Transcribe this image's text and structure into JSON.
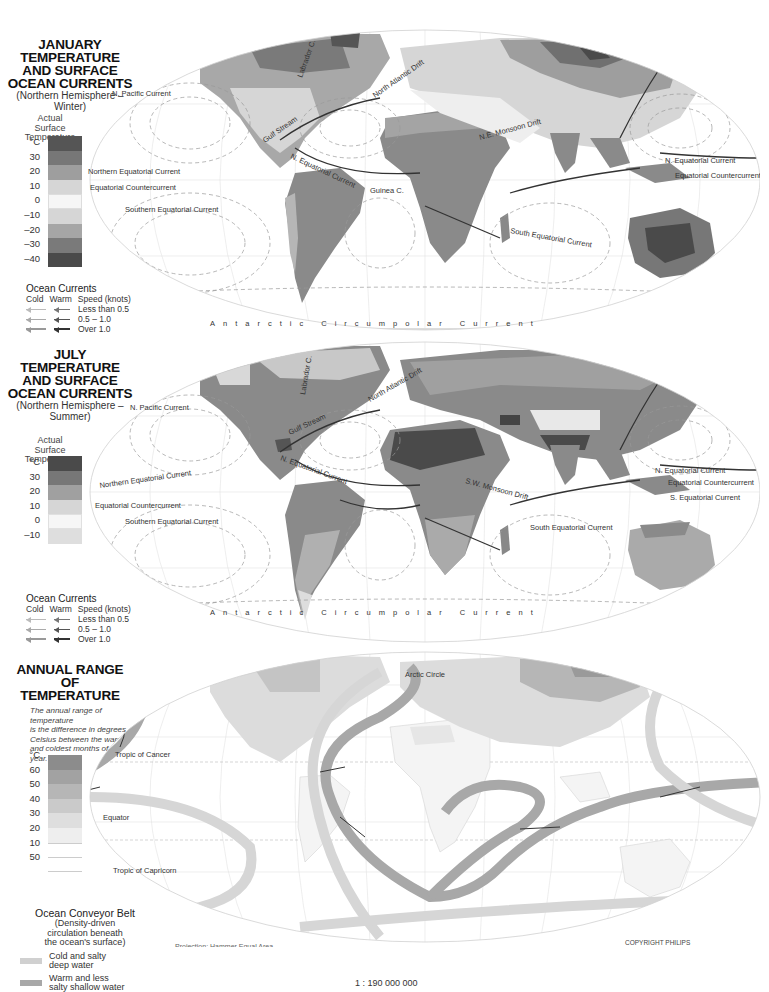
{
  "maps": [
    {
      "id": "january",
      "title_lines": [
        "JANUARY",
        "TEMPERATURE",
        "AND SURFACE",
        "OCEAN CURRENTS"
      ],
      "subtitle_lines": [
        "(Northern Hemisphere –",
        "Winter)"
      ],
      "scale_label_lines": [
        "Actual",
        "Surface",
        "Temperature"
      ],
      "scale_unit": "°C",
      "scale_ticks": [
        "30",
        "20",
        "10",
        "0",
        "–10",
        "–20",
        "–30",
        "–40"
      ],
      "scale_colors": [
        "#5a5a5a",
        "#7a7a7a",
        "#a0a0a0",
        "#d8d8d8",
        "#f4f4f4",
        "#d8d8d8",
        "#a8a8a8",
        "#7a7a7a",
        "#4a4a4a"
      ],
      "ocean_currents": {
        "title": "Ocean Currents",
        "headers": [
          "Cold",
          "Warm",
          "Speed (knots)"
        ],
        "rows": [
          "Less than 0.5",
          "0.5 – 1.0",
          "Over 1.0"
        ]
      },
      "current_labels": [
        "N. Pacific Current",
        "Californian Current",
        "Labrador C.",
        "North Atlantic Drift",
        "Gulf Stream",
        "N. Equatorial Current",
        "Northern Equatorial Current",
        "Equatorial Countercurrent",
        "Southern Equatorial Current",
        "Guinea C.",
        "Benguela Current",
        "Brazil Current",
        "Peru (Humboldt) Current",
        "Agulhas C.",
        "N.E. Monsoon Drift",
        "South Equatorial Current",
        "Oya Siwo",
        "Kuro Siwo",
        "N. Equatorial Current",
        "Equatorial Countercurrent",
        "Antarctic Circumpolar Current"
      ]
    },
    {
      "id": "july",
      "title_lines": [
        "JULY",
        "TEMPERATURE",
        "AND SURFACE",
        "OCEAN CURRENTS"
      ],
      "subtitle_lines": [
        "(Northern Hemisphere –",
        "Summer)"
      ],
      "scale_label_lines": [
        "Actual",
        "Surface",
        "Temperature"
      ],
      "scale_unit": "°C",
      "scale_ticks": [
        "30",
        "20",
        "10",
        "0",
        "–10"
      ],
      "scale_colors": [
        "#4a4a4a",
        "#7a7a7a",
        "#a0a0a0",
        "#d4d4d4",
        "#f4f4f4",
        "#dcdcdc"
      ],
      "ocean_currents": {
        "title": "Ocean Currents",
        "headers": [
          "Cold",
          "Warm",
          "Speed (knots)"
        ],
        "rows": [
          "Less than 0.5",
          "0.5 – 1.0",
          "Over 1.0"
        ]
      },
      "current_labels": [
        "N. Pacific Current",
        "Labrador C.",
        "North Atlantic Drift",
        "Gulf Stream",
        "N. Equatorial Current",
        "Northern Equatorial Current",
        "Equatorial Countercurrent",
        "Southern Equatorial Current",
        "Guinea C.",
        "Benguela Current",
        "Brazil Current",
        "Peru (Humboldt) Current",
        "Agulhas C.",
        "S.W. Monsoon Drift",
        "South Equatorial Current",
        "Oya Siwo",
        "Kuro Siwo",
        "N. Equatorial Current",
        "Equatorial Countercurrent",
        "S. Equatorial Current",
        "Antarctic Circumpolar Current"
      ]
    },
    {
      "id": "annual-range",
      "title_lines": [
        "ANNUAL RANGE",
        "OF",
        "TEMPERATURE"
      ],
      "note_lines": [
        "The annual range of temperature",
        "is the difference in degrees",
        "Celsius between the warmest",
        "and coldest months of the",
        "year."
      ],
      "scale_unit": "°C",
      "scale_ticks": [
        "60",
        "50",
        "40",
        "30",
        "20",
        "10",
        "50"
      ],
      "scale_colors": [
        "#8c8c8c",
        "#a0a0a0",
        "#b4b4b4",
        "#c8c8c8",
        "#dcdcdc",
        "#ececec",
        "#ffffff",
        "#ffffff"
      ],
      "map_labels": {
        "arctic_circle": "Arctic Circle",
        "tropic_cancer": "Tropic of Cancer",
        "equator": "Equator",
        "tropic_capricorn": "Tropic of Capricorn"
      },
      "conveyor": {
        "title": "Ocean Conveyor Belt",
        "desc_lines": [
          "(Density-driven",
          "circulation beneath",
          "the ocean's surface)"
        ],
        "items": [
          {
            "label_lines": [
              "Cold and salty",
              "deep water"
            ],
            "color": "#d0d0d0"
          },
          {
            "label_lines": [
              "Warm and less",
              "salty shallow water"
            ],
            "color": "#a8a8a8"
          }
        ]
      },
      "projection": "Projection: Hammer Equal Area",
      "copyright": "COPYRIGHT PHILIPS"
    }
  ],
  "longitude_ticks": [
    "150",
    "120",
    "90",
    "60",
    "30",
    "0",
    "30",
    "60",
    "90",
    "120",
    "150"
  ],
  "latitude_ticks": [
    "60",
    "30",
    "0",
    "30"
  ],
  "scale": "1 : 190 000 000"
}
